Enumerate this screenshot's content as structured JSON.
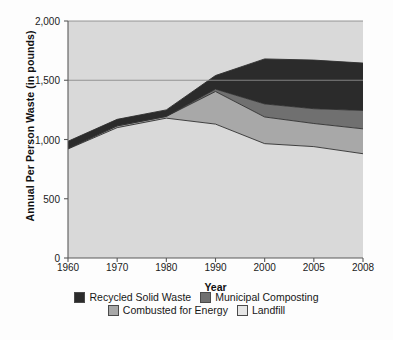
{
  "chart_data": {
    "type": "area",
    "stacked": true,
    "title": "",
    "xlabel": "Year",
    "ylabel": "Annual Per Person Waste (in pounds)",
    "categories": [
      "1960",
      "1970",
      "1980",
      "1990",
      "2000",
      "2005",
      "2008"
    ],
    "x_tick_labels": [
      "1960",
      "1970",
      "1980",
      "1990",
      "2000",
      "2005",
      "2008"
    ],
    "y_tick_labels": [
      "0",
      "500",
      "1,000",
      "1,500",
      "2,000"
    ],
    "y_tick_values": [
      0,
      500,
      1000,
      1500,
      2000
    ],
    "ylim": [
      0,
      2000
    ],
    "grid": "horizontal-at-1500-and-2000",
    "legend_position": "bottom",
    "series": [
      {
        "name": "Landfill",
        "color": "#d9d9d9",
        "values": [
          920,
          1100,
          1180,
          1130,
          965,
          940,
          880
        ]
      },
      {
        "name": "Combusted for Energy",
        "color": "#a8a8a8",
        "values": [
          5,
          15,
          15,
          275,
          225,
          195,
          210
        ]
      },
      {
        "name": "Municipal Composting",
        "color": "#707070",
        "values": [
          0,
          0,
          0,
          20,
          110,
          125,
          155
        ]
      },
      {
        "name": "Recycled Solid Waste",
        "color": "#2b2b2b",
        "values": [
          60,
          55,
          55,
          115,
          380,
          410,
          400
        ]
      }
    ],
    "stack_tops": {
      "landfill": [
        920,
        1100,
        1180,
        1130,
        965,
        940,
        880
      ],
      "combusted": [
        925,
        1115,
        1195,
        1405,
        1190,
        1135,
        1090
      ],
      "composting": [
        925,
        1115,
        1195,
        1425,
        1300,
        1260,
        1245
      ],
      "total": [
        985,
        1170,
        1250,
        1540,
        1680,
        1670,
        1645
      ]
    }
  },
  "legend": {
    "rows": [
      [
        {
          "label": "Recycled Solid Waste",
          "color": "#2b2b2b"
        },
        {
          "label": "Municipal Composting",
          "color": "#707070"
        }
      ],
      [
        {
          "label": "Combusted for Energy",
          "color": "#a8a8a8"
        },
        {
          "label": "Landfill",
          "color": "#e6e6e6"
        }
      ]
    ]
  },
  "colors": {
    "axis": "#5a5a5a",
    "gridline": "#8a8a8a",
    "plot_background": "#d9d9d9",
    "series_border": "#2f2f2f"
  }
}
